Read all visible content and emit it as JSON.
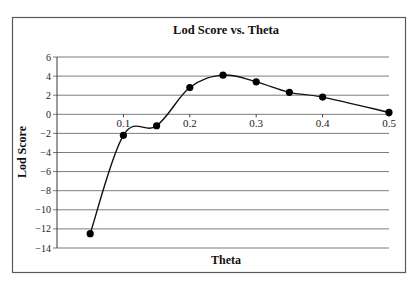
{
  "chart_data": {
    "type": "line",
    "title": "Lod Score vs. Theta",
    "xlabel": "Theta",
    "ylabel": "Lod Score",
    "x": [
      0.05,
      0.1,
      0.15,
      0.2,
      0.25,
      0.3,
      0.35,
      0.4,
      0.5
    ],
    "series": [
      {
        "name": "Lod Score",
        "values": [
          -12.5,
          -2.2,
          -1.2,
          2.8,
          4.1,
          3.4,
          2.3,
          1.8,
          0.2
        ]
      }
    ],
    "xlim": [
      0,
      0.5
    ],
    "ylim": [
      -14,
      6
    ],
    "xticks": [
      0.1,
      0.2,
      0.3,
      0.4,
      0.5
    ],
    "xtick_labels": [
      "0.1",
      "0.2",
      "0.3",
      "0.4",
      "0.5"
    ],
    "yticks": [
      6,
      4,
      2,
      0,
      -2,
      -4,
      -6,
      -8,
      -10,
      -12,
      -14
    ],
    "ytick_labels": [
      "6",
      "4",
      "2",
      "0",
      "−2",
      "−4",
      "−6",
      "−8",
      "−10",
      "−12",
      "−14"
    ],
    "grid": true,
    "smoothed": true,
    "markers": "filled-circle",
    "legend": null
  },
  "colors": {
    "line": "#111111",
    "grid": "#6e6e6e",
    "frame": "#5a5a5a",
    "background": "#ffffff"
  }
}
